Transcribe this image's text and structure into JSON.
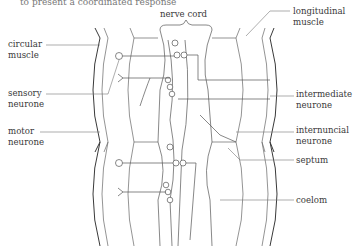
{
  "figure": {
    "cropped_top_text": "to present a coordinated response",
    "labels": {
      "nerve_cord": "nerve cord",
      "longitudinal_muscle": [
        "longitudinal",
        "muscle"
      ],
      "circular_muscle": [
        "circular",
        "muscle"
      ],
      "sensory_neurone": [
        "sensory",
        "neurone"
      ],
      "motor_neurone": [
        "motor",
        "neurone"
      ],
      "intermediate_neurone": [
        "intermediate",
        "neurone"
      ],
      "internuncial_neurone": [
        "internuncial",
        "neurone"
      ],
      "septum": "septum",
      "coelom": "coelom"
    },
    "colors": {
      "line": "#3a3a3a",
      "text": "#3a3a3a",
      "background": "#ffffff"
    }
  }
}
